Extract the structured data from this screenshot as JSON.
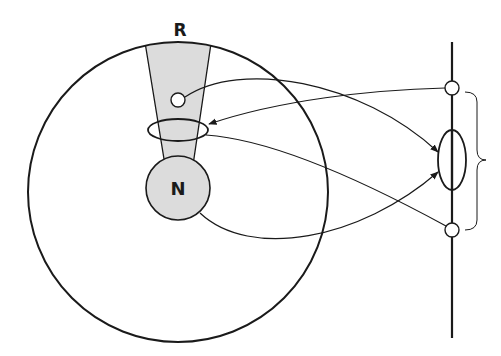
{
  "diagram": {
    "labels": {
      "top_region": "R",
      "nucleus": "N"
    },
    "colors": {
      "stroke": "#1a1a1a",
      "shaded_fill": "#dcdcdc",
      "background": "#ffffff"
    },
    "elements": {
      "outer_circle": "large circle",
      "wedge": "shaded tapered column from R to N",
      "small_circle": "small open circle inside column",
      "ellipse_on_column": "horizontal ellipse around column",
      "nucleus_circle": "shaded circle labeled N",
      "vertical_axis": "vertical line on right",
      "axis_top_circle": "small circle on axis (top)",
      "axis_bottom_circle": "small circle on axis (bottom)",
      "axis_ellipse": "vertical ellipse on axis",
      "brace": "curly brace spanning top and bottom axis circles"
    }
  }
}
